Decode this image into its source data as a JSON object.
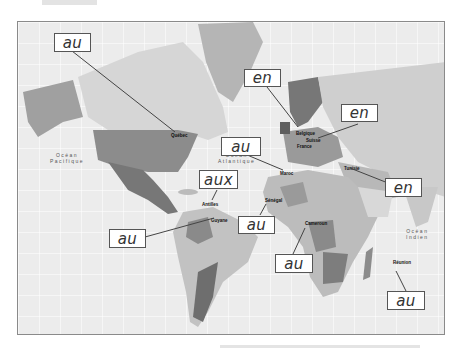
{
  "map": {
    "oceans": [
      {
        "id": "pacific",
        "label": "Océan\nPacifique"
      },
      {
        "id": "atlantic",
        "label": "Océan\nAtlantique"
      },
      {
        "id": "indian",
        "label": "Océan\nIndien"
      }
    ],
    "places": [
      {
        "id": "quebec",
        "label": "Québec"
      },
      {
        "id": "belgique",
        "label": "Belgique"
      },
      {
        "id": "suisse",
        "label": "Suisse"
      },
      {
        "id": "france",
        "label": "France"
      },
      {
        "id": "maroc",
        "label": "Maroc"
      },
      {
        "id": "tunisie",
        "label": "Tunisie"
      },
      {
        "id": "antilles",
        "label": "Antilles"
      },
      {
        "id": "guyane",
        "label": "Guyane"
      },
      {
        "id": "senegal",
        "label": "Sénégal"
      },
      {
        "id": "cameroun",
        "label": "Cameroun"
      },
      {
        "id": "reunion",
        "label": "Réunion"
      }
    ],
    "colors": {
      "ocean": "#ececec",
      "land_light": "#d6d6d6",
      "land_mid": "#b5b5b5",
      "land_dark": "#8c8c8c",
      "land_darker": "#6e6e6e",
      "border": "#8a8a8a"
    }
  },
  "annotations": [
    {
      "id": "quebec",
      "text": "au"
    },
    {
      "id": "belgique",
      "text": "en"
    },
    {
      "id": "suisse",
      "text": "en"
    },
    {
      "id": "maroc",
      "text": "au"
    },
    {
      "id": "tunisie",
      "text": "en"
    },
    {
      "id": "antilles",
      "text": "aux"
    },
    {
      "id": "guyane",
      "text": "au"
    },
    {
      "id": "senegal",
      "text": "au"
    },
    {
      "id": "cameroun",
      "text": "au"
    },
    {
      "id": "reunion",
      "text": "au"
    }
  ]
}
